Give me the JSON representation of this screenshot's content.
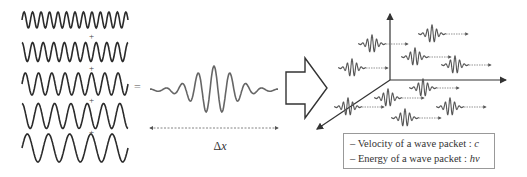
{
  "component_waves": {
    "count": 5,
    "cycles": [
      12.5,
      10,
      8,
      6.5,
      5
    ],
    "joiner": "+"
  },
  "equals_sign": "=",
  "wave_packet": {
    "width_label_prefix": "Δ",
    "width_label_var": "x"
  },
  "transform_arrow": "right-block-arrow",
  "axes_3d": {
    "origin": [
      390,
      80
    ],
    "axes": [
      "up",
      "right",
      "down-left"
    ]
  },
  "packets_in_space": [
    {
      "x": 372,
      "y": 44
    },
    {
      "x": 432,
      "y": 34
    },
    {
      "x": 415,
      "y": 57
    },
    {
      "x": 455,
      "y": 65
    },
    {
      "x": 352,
      "y": 68
    },
    {
      "x": 423,
      "y": 88
    },
    {
      "x": 388,
      "y": 98
    },
    {
      "x": 348,
      "y": 107
    },
    {
      "x": 450,
      "y": 107
    },
    {
      "x": 405,
      "y": 118
    }
  ],
  "legend": {
    "line1_text": "– Velocity of a wave packet : ",
    "line1_sym": "c",
    "line2_text": "– Energy of a wave packet : ",
    "line2_sym": "hν"
  }
}
